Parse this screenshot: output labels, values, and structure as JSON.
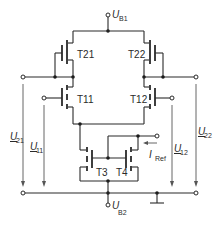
{
  "diagram": {
    "type": "circuit-schematic",
    "supplies": {
      "top": {
        "symbol": "U",
        "sub": "B1"
      },
      "bottom": {
        "symbol": "U",
        "sub": "B2"
      }
    },
    "transistors": [
      {
        "id": "T21",
        "label": "T21"
      },
      {
        "id": "T22",
        "label": "T22"
      },
      {
        "id": "T11",
        "label": "T11"
      },
      {
        "id": "T12",
        "label": "T12"
      },
      {
        "id": "T3",
        "label": "T3"
      },
      {
        "id": "T4",
        "label": "T4"
      }
    ],
    "voltages": [
      {
        "id": "U21",
        "symbol": "U",
        "sub": "21"
      },
      {
        "id": "U11",
        "symbol": "U",
        "sub": "11"
      },
      {
        "id": "U12",
        "symbol": "U",
        "sub": "12"
      },
      {
        "id": "U22",
        "symbol": "U",
        "sub": "22"
      }
    ],
    "current": {
      "symbol": "I",
      "sub": "Ref"
    }
  }
}
